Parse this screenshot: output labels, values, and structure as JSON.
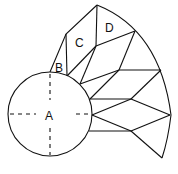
{
  "diagram": {
    "type": "geometric-figure",
    "labels": {
      "A": "A",
      "B": "B",
      "C": "C",
      "D": "D"
    },
    "colors": {
      "stroke": "#111111",
      "background": "#ffffff"
    }
  }
}
